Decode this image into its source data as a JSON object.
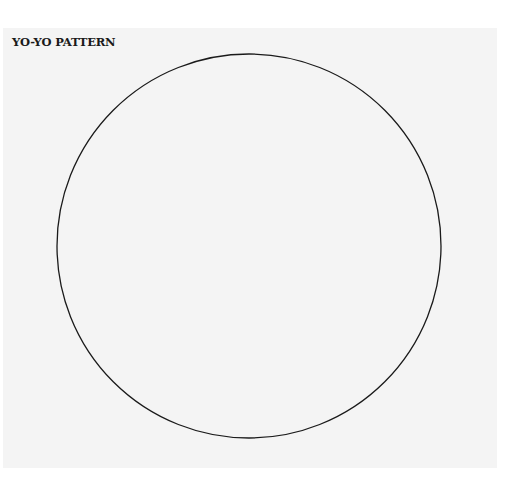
{
  "title": "YO-YO PATTERN",
  "pattern": {
    "shape": "circle",
    "center_x": 249,
    "center_y": 246,
    "radius": 192,
    "stroke_color": "#1a1a1a",
    "stroke_width": 1.3
  },
  "colors": {
    "background": "#ffffff",
    "paper": "#f4f4f4"
  }
}
